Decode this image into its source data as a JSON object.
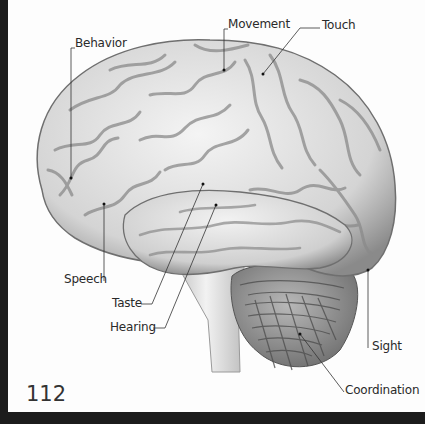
{
  "figure": {
    "labels": [
      {
        "id": "behavior",
        "text": "Behavior"
      },
      {
        "id": "movement",
        "text": "Movement"
      },
      {
        "id": "touch",
        "text": "Touch"
      },
      {
        "id": "speech",
        "text": "Speech"
      },
      {
        "id": "taste",
        "text": "Taste"
      },
      {
        "id": "hearing",
        "text": "Hearing"
      },
      {
        "id": "sight",
        "text": "Sight"
      },
      {
        "id": "coordination",
        "text": "Coordination"
      }
    ]
  },
  "page": {
    "number": "112"
  },
  "colors": {
    "background": "#fdfdfd",
    "border": "#1c1c1c",
    "brain_light": "#ececec",
    "brain_dark": "#6a6a6a"
  }
}
